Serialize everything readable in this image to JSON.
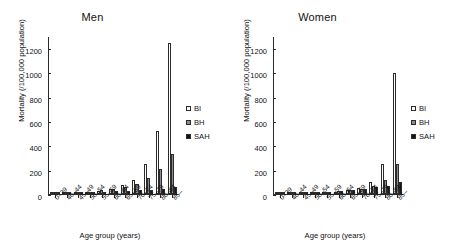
{
  "figure": {
    "axis_title_x": "Age group (years)",
    "axis_title_y": "Mortality (/100,000 population)"
  },
  "panels": [
    {
      "key": "men",
      "title": "Men"
    },
    {
      "key": "women",
      "title": "Women"
    }
  ],
  "legend": {
    "items": [
      {
        "key": "bi",
        "label": "BI",
        "color": "#ffffff"
      },
      {
        "key": "bh",
        "label": "BH",
        "color": "#8d8d8d"
      },
      {
        "key": "sah",
        "label": "SAH",
        "color": "#151515"
      }
    ]
  },
  "axis": {
    "y_ticks": [
      0,
      200,
      400,
      600,
      800,
      1000,
      1200
    ],
    "y_min": 0,
    "y_max": 1300,
    "x_categories": [
      "0–39",
      "40–44",
      "45–49",
      "50–54",
      "55–59",
      "60–64",
      "65–69",
      "70–74",
      "75–79",
      "80–84",
      "85–"
    ]
  },
  "chart_data": [
    {
      "type": "bar",
      "title": "Men",
      "xlabel": "Age group (years)",
      "ylabel": "Mortality (/100,000 population)",
      "ylim": [
        0,
        1300
      ],
      "yticks": [
        0,
        200,
        400,
        600,
        800,
        1000,
        1200
      ],
      "grid": false,
      "legend_position": "right",
      "categories": [
        "0–39",
        "40–44",
        "45–49",
        "50–54",
        "55–59",
        "60–64",
        "65–69",
        "70–74",
        "75–79",
        "80–84",
        "85–"
      ],
      "series": [
        {
          "name": "BI",
          "values": [
            2,
            5,
            9,
            16,
            26,
            45,
            75,
            120,
            250,
            520,
            1250
          ]
        },
        {
          "name": "BH",
          "values": [
            3,
            7,
            12,
            20,
            30,
            42,
            60,
            85,
            132,
            208,
            330
          ]
        },
        {
          "name": "SAH",
          "values": [
            2,
            5,
            9,
            14,
            20,
            24,
            28,
            30,
            32,
            40,
            58
          ]
        }
      ]
    },
    {
      "type": "bar",
      "title": "Women",
      "xlabel": "Age group (years)",
      "ylabel": "Mortality (/100,000 population)",
      "ylim": [
        0,
        1300
      ],
      "yticks": [
        0,
        200,
        400,
        600,
        800,
        1000,
        1200
      ],
      "grid": false,
      "legend_position": "right",
      "categories": [
        "0–39",
        "40–44",
        "45–49",
        "50–54",
        "55–59",
        "60–64",
        "65–69",
        "70–74",
        "75–79",
        "80–84",
        "85–"
      ],
      "series": [
        {
          "name": "BI",
          "values": [
            1,
            2,
            4,
            7,
            12,
            20,
            32,
            52,
            98,
            250,
            1000
          ]
        },
        {
          "name": "BH",
          "values": [
            1,
            3,
            5,
            9,
            14,
            21,
            30,
            45,
            70,
            120,
            250
          ]
        },
        {
          "name": "SAH",
          "values": [
            1,
            3,
            6,
            10,
            16,
            22,
            30,
            42,
            58,
            68,
            98
          ]
        }
      ]
    }
  ]
}
